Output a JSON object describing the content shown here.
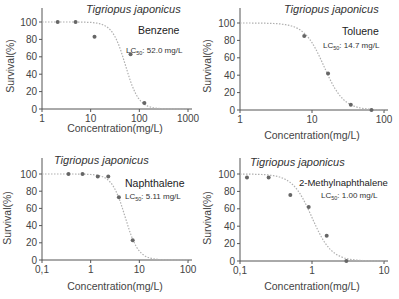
{
  "figure": {
    "species": "Tigriopus japonicus",
    "ylabel": "Survival(%)",
    "xlabel": "Concentration(mg/L)",
    "colors": {
      "axis": "#555555",
      "points": "#666666",
      "curve": "#b0b0b0",
      "text": "#444444"
    }
  },
  "panels": [
    {
      "chemical": "Benzene",
      "lc_prefix": "LC",
      "lc_sub": "50",
      "lc_value": ": 52.0 mg/L",
      "xticks": [
        "1",
        "10",
        "100",
        "1000"
      ],
      "yticks": [
        "0",
        "20",
        "40",
        "60",
        "80",
        "100"
      ]
    },
    {
      "chemical": "Toluene",
      "lc_prefix": "LC",
      "lc_sub": "50",
      "lc_value": ": 14.7 mg/L",
      "xticks": [
        "1",
        "10",
        "100"
      ],
      "yticks": [
        "0",
        "20",
        "40",
        "60",
        "80",
        "100"
      ]
    },
    {
      "chemical": "Naphthalene",
      "lc_prefix": "LC",
      "lc_sub": "50",
      "lc_value": ": 5.11 mg/L",
      "xticks": [
        "0.1",
        "1",
        "10",
        "100"
      ],
      "yticks": [
        "0",
        "20",
        "40",
        "60",
        "80",
        "100"
      ]
    },
    {
      "chemical": "2-Methylnaphthalene",
      "lc_prefix": "LC",
      "lc_sub": "50",
      "lc_value": ": 1.00 mg/L",
      "xticks": [
        "0.1",
        "1",
        "10"
      ],
      "yticks": [
        "0",
        "20",
        "40",
        "60",
        "80",
        "100"
      ]
    }
  ],
  "chart_data": [
    {
      "type": "scatter",
      "title": "Tigriopus japonicus — Benzene",
      "annotation": "LC50: 52.0 mg/L",
      "xlabel": "Concentration(mg/L)",
      "ylabel": "Survival(%)",
      "xscale": "log",
      "xlim": [
        1,
        1000
      ],
      "ylim": [
        0,
        100
      ],
      "yticks": [
        0,
        20,
        40,
        60,
        80,
        100
      ],
      "xticks": [
        1,
        10,
        100,
        1000
      ],
      "x": [
        2.1,
        4.9,
        12,
        66,
        127
      ],
      "y": [
        100,
        100,
        83,
        63,
        7
      ],
      "fit": {
        "type": "dose-response",
        "lc50": 52.0,
        "style": "dotted"
      },
      "grid": false
    },
    {
      "type": "scatter",
      "title": "Tigriopus japonicus — Toluene",
      "annotation": "LC50: 14.7 mg/L",
      "xlabel": "Concentration(mg/L)",
      "ylabel": "Survival(%)",
      "xscale": "log",
      "xlim": [
        1,
        100
      ],
      "ylim": [
        0,
        100
      ],
      "yticks": [
        0,
        20,
        40,
        60,
        80,
        100
      ],
      "xticks": [
        1,
        10,
        100
      ],
      "x": [
        7.8,
        16.7,
        34.6,
        67
      ],
      "y": [
        85,
        42,
        6,
        0
      ],
      "fit": {
        "type": "dose-response",
        "lc50": 14.7,
        "style": "dotted"
      },
      "grid": false
    },
    {
      "type": "scatter",
      "title": "Tigriopus japonicus — Naphthalene",
      "annotation": "LC50: 5.11 mg/L",
      "xlabel": "Concentration(mg/L)",
      "ylabel": "Survival(%)",
      "xscale": "log",
      "xlim": [
        0.1,
        100
      ],
      "ylim": [
        0,
        100
      ],
      "yticks": [
        0,
        20,
        40,
        60,
        80,
        100
      ],
      "xticks": [
        0.1,
        1,
        10,
        100
      ],
      "x": [
        0.35,
        0.68,
        1.4,
        2.3,
        3.8,
        7.3
      ],
      "y": [
        100,
        100,
        97,
        97,
        73,
        23
      ],
      "fit": {
        "type": "dose-response",
        "lc50": 5.11,
        "style": "dotted"
      },
      "grid": false
    },
    {
      "type": "scatter",
      "title": "Tigriopus japonicus — 2-Methylnaphthalene",
      "annotation": "LC50: 1.00 mg/L",
      "xlabel": "Concentration(mg/L)",
      "ylabel": "Survival(%)",
      "xscale": "log",
      "xlim": [
        0.1,
        10
      ],
      "ylim": [
        0,
        100
      ],
      "yticks": [
        0,
        20,
        40,
        60,
        80,
        100
      ],
      "xticks": [
        0.1,
        1,
        10
      ],
      "x": [
        0.125,
        0.25,
        0.5,
        0.9,
        1.6,
        3.0
      ],
      "y": [
        96,
        96,
        76,
        62,
        29,
        0
      ],
      "fit": {
        "type": "dose-response",
        "lc50": 1.0,
        "style": "dotted"
      },
      "grid": false
    }
  ]
}
